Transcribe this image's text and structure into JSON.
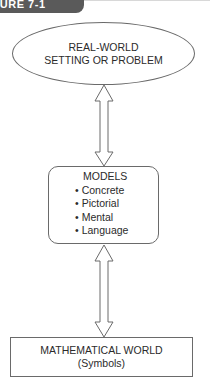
{
  "figure": {
    "label": "FIGURE 7-1"
  },
  "nodes": {
    "real_world": {
      "line1": "REAL-WORLD",
      "line2": "SETTING OR PROBLEM"
    },
    "models": {
      "title": "MODELS",
      "items": [
        "Concrete",
        "Pictorial",
        "Mental",
        "Language"
      ]
    },
    "math_world": {
      "line1": "MATHEMATICAL WORLD",
      "line2": "(Symbols)"
    }
  },
  "edges": [
    {
      "from": "real_world",
      "to": "models",
      "type": "bidirectional-arrow"
    },
    {
      "from": "models",
      "to": "math_world",
      "type": "bidirectional-arrow"
    }
  ],
  "colors": {
    "tab_bg": "#5a5a5a",
    "stroke": "#6a6a6a",
    "text": "#2b2b2b"
  }
}
